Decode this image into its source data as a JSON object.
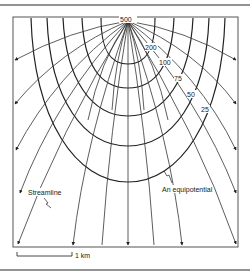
{
  "figure": {
    "type": "flow-net",
    "source_point": {
      "x": 128,
      "y": 21
    },
    "equipotential_labels": [
      "500",
      "200",
      "100",
      "75",
      "50",
      "25"
    ],
    "annotations": {
      "streamline": "Streamline",
      "equipotential": "An equipotential"
    },
    "scale_bar": {
      "label": "1 km"
    }
  },
  "colors": {
    "line": "#222222",
    "frame": "#555555",
    "background": "#ffffff"
  }
}
